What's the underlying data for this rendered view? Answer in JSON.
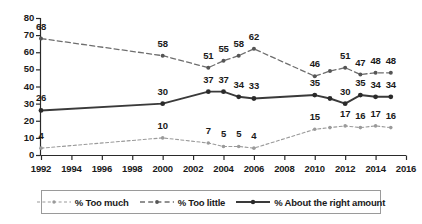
{
  "chart_data": {
    "type": "line",
    "title": "",
    "subtitle": "",
    "xlabel": "",
    "ylabel": "",
    "xlim": [
      1992,
      2016
    ],
    "ylim": [
      0,
      80
    ],
    "ytick_step": 10,
    "xtick_step": 2,
    "grid": false,
    "legend_position": "bottom",
    "x": [
      1992,
      2000,
      2003,
      2004,
      2005,
      2006,
      2010,
      2011,
      2012,
      2013,
      2014,
      2015
    ],
    "y_ticks": [
      "0",
      "10",
      "20",
      "30",
      "40",
      "50",
      "60",
      "70",
      "80"
    ],
    "x_ticks": [
      "1992",
      "1994",
      "1996",
      "1998",
      "2000",
      "2002",
      "2004",
      "2006",
      "2008",
      "2010",
      "2012",
      "2014",
      "2016"
    ],
    "series": [
      {
        "name": "% Too much",
        "key": "too_much",
        "color": "#9a9a9a",
        "style": "dashed-light",
        "values": [
          4,
          10,
          7,
          5,
          5,
          4,
          15,
          16,
          17,
          16,
          17,
          16
        ],
        "labels": [
          "4",
          "10",
          "7",
          "5",
          "5",
          "4",
          "15",
          "",
          "17",
          "16",
          "17",
          "16"
        ]
      },
      {
        "name": "% Too little",
        "key": "too_little",
        "color": "#6e6e6e",
        "style": "dashed-dark",
        "values": [
          68,
          58,
          51,
          55,
          58,
          62,
          46,
          49,
          51,
          47,
          48,
          48
        ],
        "labels": [
          "68",
          "58",
          "51",
          "55",
          "58",
          "62",
          "46",
          "",
          "51",
          "47",
          "48",
          "48"
        ]
      },
      {
        "name": "% About the right amount",
        "key": "about_right",
        "color": "#3a3a3a",
        "style": "solid",
        "values": [
          26,
          30,
          37,
          37,
          34,
          33,
          35,
          33,
          30,
          35,
          34,
          34
        ],
        "labels": [
          "26",
          "30",
          "37",
          "37",
          "34",
          "33",
          "35",
          "",
          "30",
          "35",
          "34",
          "34"
        ]
      }
    ]
  },
  "legend": {
    "items": [
      {
        "label": "% Too much",
        "icon": "dashed-light-line-marker-icon"
      },
      {
        "label": "% Too little",
        "icon": "dashed-dark-line-marker-icon"
      },
      {
        "label": "% About the right amount",
        "icon": "solid-dark-line-marker-icon"
      }
    ]
  },
  "axes": {
    "y_axis_name": "percent-axis",
    "x_axis_name": "year-axis"
  }
}
